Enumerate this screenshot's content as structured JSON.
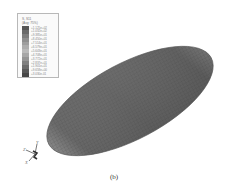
{
  "figure": {
    "caption": "(b)",
    "legend": {
      "title": "S, S11",
      "subtitle": "(Avg: 75%)",
      "entries": [
        {
          "label": "+1.125e+02",
          "color": "#555555"
        },
        {
          "label": "+1.032e+02",
          "color": "#6a6a6a"
        },
        {
          "label": "+9.385e+01",
          "color": "#7d7d7d"
        },
        {
          "label": "+8.450e+01",
          "color": "#8f8f8f"
        },
        {
          "label": "+7.514e+01",
          "color": "#9e9e9e"
        },
        {
          "label": "+6.579e+01",
          "color": "#adadad"
        },
        {
          "label": "+5.643e+01",
          "color": "#b9b9b9"
        },
        {
          "label": "+4.708e+01",
          "color": "#a6a6a6"
        },
        {
          "label": "+3.772e+01",
          "color": "#949494"
        },
        {
          "label": "+2.837e+01",
          "color": "#7f7f7f"
        },
        {
          "label": "+1.901e+01",
          "color": "#6b6b6b"
        },
        {
          "label": "+9.658e+00",
          "color": "#585858"
        },
        {
          "label": "+3.030e-01",
          "color": "#474747"
        }
      ]
    },
    "triad": {
      "x": "X",
      "y": "Y",
      "z": "Z"
    },
    "model": {
      "shape": "ellipsoid",
      "mesh": "quad surface mesh",
      "colors": {
        "body": "#5e5e5e",
        "end_left": "#b4b4b4",
        "end_right": "#9a9a9a",
        "mesh_line": "#3e3e3e"
      }
    }
  }
}
